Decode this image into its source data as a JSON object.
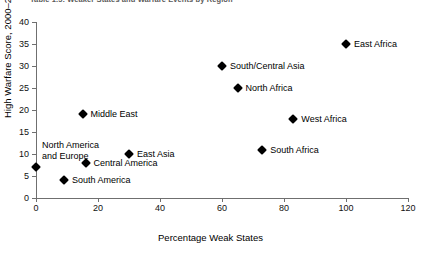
{
  "caption": "Table 1.5:  Weaker States and Warfare Events by Region",
  "chart_data": {
    "type": "scatter",
    "title": "Table 1.5:  Weaker States and Warfare Events by Region",
    "xlabel": "Percentage Weak States",
    "ylabel": "High Warfare Score, 2000–2005",
    "xlim": [
      0,
      120
    ],
    "ylim": [
      0,
      40
    ],
    "xticks": [
      0,
      20,
      40,
      60,
      80,
      100,
      120
    ],
    "yticks": [
      0,
      5,
      10,
      15,
      20,
      25,
      30,
      35,
      40
    ],
    "grid": false,
    "legend": "none",
    "marker": "diamond",
    "marker_color": "#000000",
    "points": [
      {
        "label": "East Africa",
        "x": 100,
        "y": 35
      },
      {
        "label": "South/Central Asia",
        "x": 60,
        "y": 30
      },
      {
        "label": "North Africa",
        "x": 65,
        "y": 25
      },
      {
        "label": "West Africa",
        "x": 83,
        "y": 18
      },
      {
        "label": "Middle East",
        "x": 15,
        "y": 19
      },
      {
        "label": "South Africa",
        "x": 73,
        "y": 11
      },
      {
        "label": "East Asia",
        "x": 30,
        "y": 10
      },
      {
        "label": "Central America",
        "x": 16,
        "y": 8
      },
      {
        "label": "North America and Europe",
        "x": 0,
        "y": 7
      },
      {
        "label": "South America",
        "x": 9,
        "y": 4
      }
    ]
  }
}
